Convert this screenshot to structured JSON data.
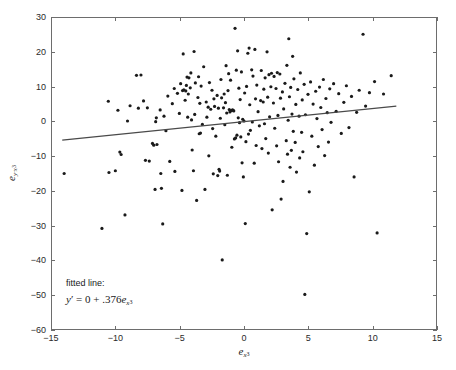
{
  "figure": {
    "top_caption_fragment": "",
    "background_color": "#ffffff",
    "axis_color": "#6d6d6d",
    "marker_color": "#1a1a1a",
    "line_color": "#4a4a4a"
  },
  "axes": {
    "xlabel_base": "e",
    "xlabel_sub": "x",
    "xlabel_subsub": "3",
    "ylabel_base": "e",
    "ylabel_sub": "y·x",
    "ylabel_subsub": "3"
  },
  "annotation": {
    "title": "fitted line:",
    "eq_y": "y",
    "eq_prime": "′",
    "eq_equals": " = 0 + .376",
    "eq_e": "e",
    "eq_sub": "x",
    "eq_subsub": "3",
    "intercept": 0,
    "slope": 0.376
  },
  "chart_data": {
    "type": "scatter",
    "title": "",
    "subtitle": "",
    "xlabel": "e_x3",
    "ylabel": "e_y·x3",
    "xlim": [
      -15,
      15
    ],
    "ylim": [
      -60,
      30
    ],
    "xticks": [
      -15,
      -10,
      -5,
      0,
      5,
      10,
      15
    ],
    "yticks": [
      30,
      20,
      10,
      0,
      -10,
      -20,
      -30,
      -40,
      -50,
      -60
    ],
    "xticklabels": [
      "−15",
      "−10",
      "−5",
      "0",
      "5",
      "10",
      "15"
    ],
    "yticklabels": [
      "30",
      "20",
      "10",
      "0",
      "−10",
      "−20",
      "−30",
      "−40",
      "−50",
      "−60"
    ],
    "grid": false,
    "legend": null,
    "marker": "dot",
    "marker_size": 1.6,
    "n_points": 232,
    "fit_line": {
      "type": "line",
      "label": "fitted line",
      "intercept": 0,
      "slope": 0.376,
      "x_start": -14.2,
      "x_end": 11.9,
      "y_start": -5.34,
      "y_end": 4.47
    },
    "annotations": [
      {
        "text": "fitted line:  y' = 0 + .376e_x3",
        "x": -13.0,
        "y": -50.5
      }
    ],
    "points": [
      [
        -14.05,
        -15.0
      ],
      [
        -11.1,
        -30.9
      ],
      [
        -10.6,
        5.9
      ],
      [
        -10.55,
        -14.7
      ],
      [
        -10.05,
        -14.2
      ],
      [
        -9.85,
        3.3
      ],
      [
        -9.7,
        -8.8
      ],
      [
        -9.6,
        -9.5
      ],
      [
        -9.3,
        -27.0
      ],
      [
        -9.1,
        0.2
      ],
      [
        -8.9,
        4.6
      ],
      [
        -8.4,
        13.4
      ],
      [
        -8.25,
        3.9
      ],
      [
        -8.05,
        13.5
      ],
      [
        -7.85,
        6.0
      ],
      [
        -7.7,
        -11.2
      ],
      [
        -7.55,
        4.0
      ],
      [
        -7.4,
        -11.4
      ],
      [
        -7.15,
        -6.3
      ],
      [
        -7.05,
        -6.8
      ],
      [
        -6.95,
        -19.6
      ],
      [
        -6.9,
        0.0
      ],
      [
        -6.85,
        1.1
      ],
      [
        -6.8,
        -6.6
      ],
      [
        -6.55,
        3.4
      ],
      [
        -6.5,
        -15.0
      ],
      [
        -6.45,
        -19.3
      ],
      [
        -6.35,
        -29.6
      ],
      [
        -6.25,
        1.6
      ],
      [
        -6.1,
        -2.6
      ],
      [
        -5.95,
        7.4
      ],
      [
        -5.8,
        -11.5
      ],
      [
        -5.6,
        5.2
      ],
      [
        -5.45,
        9.6
      ],
      [
        -5.4,
        -14.4
      ],
      [
        -5.2,
        8.2
      ],
      [
        -5.05,
        2.4
      ],
      [
        -4.95,
        11.0
      ],
      [
        -4.85,
        -19.9
      ],
      [
        -4.8,
        9.0
      ],
      [
        -4.75,
        19.6
      ],
      [
        -4.7,
        9.2
      ],
      [
        -4.6,
        6.2
      ],
      [
        -4.55,
        8.9
      ],
      [
        -4.5,
        10.5
      ],
      [
        -4.45,
        12.9
      ],
      [
        -4.4,
        1.3
      ],
      [
        -4.35,
        8.0
      ],
      [
        -4.3,
        12.7
      ],
      [
        -4.2,
        9.8
      ],
      [
        -4.15,
        14.1
      ],
      [
        -4.1,
        0.5
      ],
      [
        -4.05,
        -8.2
      ],
      [
        -3.95,
        -14.2
      ],
      [
        -3.9,
        20.3
      ],
      [
        -3.85,
        2.1
      ],
      [
        -3.8,
        11.2
      ],
      [
        -3.7,
        -22.8
      ],
      [
        -3.6,
        7.0
      ],
      [
        -3.55,
        13.0
      ],
      [
        -3.5,
        -3.5
      ],
      [
        -3.45,
        5.3
      ],
      [
        -3.4,
        -3.3
      ],
      [
        -3.35,
        10.3
      ],
      [
        -3.25,
        -0.8
      ],
      [
        -3.15,
        15.9
      ],
      [
        -3.05,
        -19.6
      ],
      [
        -2.95,
        5.7
      ],
      [
        -2.9,
        1.3
      ],
      [
        -2.8,
        4.2
      ],
      [
        -2.75,
        -9.9
      ],
      [
        -2.7,
        11.3
      ],
      [
        -2.6,
        3.6
      ],
      [
        -2.5,
        9.1
      ],
      [
        -2.45,
        -2.0
      ],
      [
        -2.4,
        -15.1
      ],
      [
        -2.35,
        6.6
      ],
      [
        -2.3,
        4.4
      ],
      [
        -2.2,
        -4.2
      ],
      [
        -2.1,
        7.6
      ],
      [
        -2.05,
        -15.6
      ],
      [
        -2.0,
        3.9
      ],
      [
        -1.95,
        -13.8
      ],
      [
        -1.9,
        -14.3
      ],
      [
        -1.85,
        1.0
      ],
      [
        -1.8,
        12.2
      ],
      [
        -1.75,
        6.9
      ],
      [
        -1.7,
        -40.0
      ],
      [
        -1.6,
        4.0
      ],
      [
        -1.55,
        8.0
      ],
      [
        -1.5,
        -0.9
      ],
      [
        -1.45,
        5.5
      ],
      [
        -1.4,
        16.2
      ],
      [
        -1.35,
        2.5
      ],
      [
        -1.3,
        -15.5
      ],
      [
        -1.25,
        9.0
      ],
      [
        -1.2,
        13.9
      ],
      [
        -1.15,
        3.5
      ],
      [
        -1.1,
        2.8
      ],
      [
        -1.05,
        12.0
      ],
      [
        -1.0,
        3.2
      ],
      [
        -0.95,
        -7.4
      ],
      [
        -0.9,
        3.4
      ],
      [
        -0.85,
        3.3
      ],
      [
        -0.8,
        3.1
      ],
      [
        -0.75,
        -5.0
      ],
      [
        -0.7,
        27.0
      ],
      [
        -0.65,
        -4.7
      ],
      [
        -0.6,
        14.9
      ],
      [
        -0.55,
        -3.9
      ],
      [
        -0.5,
        20.5
      ],
      [
        -0.45,
        1.1
      ],
      [
        -0.4,
        9.7
      ],
      [
        -0.35,
        -0.3
      ],
      [
        -0.3,
        6.4
      ],
      [
        -0.25,
        -4.4
      ],
      [
        -0.2,
        14.4
      ],
      [
        -0.15,
        -11.9
      ],
      [
        -0.1,
        0.7
      ],
      [
        -0.05,
        -16.0
      ],
      [
        0.0,
        0.2
      ],
      [
        0.05,
        8.3
      ],
      [
        0.1,
        -29.5
      ],
      [
        0.15,
        -5.8
      ],
      [
        0.2,
        10.2
      ],
      [
        0.3,
        19.8
      ],
      [
        0.35,
        -3.6
      ],
      [
        0.4,
        21.3
      ],
      [
        0.45,
        4.9
      ],
      [
        0.5,
        -2.5
      ],
      [
        0.6,
        15.0
      ],
      [
        0.65,
        -0.1
      ],
      [
        0.7,
        13.2
      ],
      [
        0.8,
        -12.0
      ],
      [
        0.85,
        20.9
      ],
      [
        0.9,
        6.6
      ],
      [
        0.95,
        -6.9
      ],
      [
        1.0,
        10.6
      ],
      [
        1.1,
        2.9
      ],
      [
        1.2,
        -1.2
      ],
      [
        1.3,
        6.1
      ],
      [
        1.35,
        14.8
      ],
      [
        1.4,
        -7.8
      ],
      [
        1.5,
        5.7
      ],
      [
        1.55,
        9.4
      ],
      [
        1.6,
        -0.6
      ],
      [
        1.65,
        12.7
      ],
      [
        1.7,
        -4.9
      ],
      [
        1.8,
        20.2
      ],
      [
        1.85,
        7.1
      ],
      [
        1.9,
        -9.1
      ],
      [
        1.95,
        13.6
      ],
      [
        2.0,
        1.4
      ],
      [
        2.1,
        10.1
      ],
      [
        2.15,
        14.0
      ],
      [
        2.2,
        -25.5
      ],
      [
        2.3,
        5.4
      ],
      [
        2.35,
        13.1
      ],
      [
        2.4,
        -1.9
      ],
      [
        2.5,
        9.6
      ],
      [
        2.55,
        -7.0
      ],
      [
        2.6,
        14.2
      ],
      [
        2.65,
        1.8
      ],
      [
        2.7,
        -11.6
      ],
      [
        2.8,
        13.8
      ],
      [
        2.85,
        6.8
      ],
      [
        2.9,
        -22.4
      ],
      [
        3.0,
        8.6
      ],
      [
        3.05,
        -17.3
      ],
      [
        3.1,
        3.7
      ],
      [
        3.2,
        11.1
      ],
      [
        3.3,
        -5.5
      ],
      [
        3.35,
        16.3
      ],
      [
        3.4,
        -9.4
      ],
      [
        3.45,
        0.4
      ],
      [
        3.5,
        24.0
      ],
      [
        3.55,
        7.2
      ],
      [
        3.6,
        -13.2
      ],
      [
        3.65,
        9.9
      ],
      [
        3.7,
        -8.3
      ],
      [
        3.75,
        2.2
      ],
      [
        3.8,
        18.9
      ],
      [
        3.85,
        -2.8
      ],
      [
        3.9,
        12.4
      ],
      [
        4.0,
        -6.0
      ],
      [
        4.05,
        5.0
      ],
      [
        4.1,
        -14.6
      ],
      [
        4.2,
        9.3
      ],
      [
        4.3,
        1.6
      ],
      [
        4.35,
        -10.5
      ],
      [
        4.4,
        14.1
      ],
      [
        4.5,
        -3.1
      ],
      [
        4.55,
        6.3
      ],
      [
        4.6,
        -8.7
      ],
      [
        4.7,
        10.8
      ],
      [
        4.75,
        -50.0
      ],
      [
        4.8,
        2.0
      ],
      [
        4.9,
        -32.4
      ],
      [
        5.0,
        7.9
      ],
      [
        5.1,
        -20.3
      ],
      [
        5.2,
        11.5
      ],
      [
        5.3,
        -4.2
      ],
      [
        5.4,
        5.1
      ],
      [
        5.5,
        -12.6
      ],
      [
        5.6,
        8.8
      ],
      [
        5.7,
        0.9
      ],
      [
        5.8,
        -7.2
      ],
      [
        5.9,
        10.0
      ],
      [
        6.0,
        4.1
      ],
      [
        6.1,
        -2.3
      ],
      [
        6.2,
        12.2
      ],
      [
        6.3,
        -9.8
      ],
      [
        6.4,
        6.7
      ],
      [
        6.5,
        2.6
      ],
      [
        6.6,
        -5.9
      ],
      [
        6.7,
        9.5
      ],
      [
        6.8,
        -0.2
      ],
      [
        7.0,
        11.0
      ],
      [
        7.2,
        3.0
      ],
      [
        7.4,
        8.1
      ],
      [
        7.6,
        -3.4
      ],
      [
        7.8,
        5.6
      ],
      [
        8.0,
        10.4
      ],
      [
        8.2,
        -1.7
      ],
      [
        8.4,
        7.3
      ],
      [
        8.6,
        -16.0
      ],
      [
        8.8,
        2.7
      ],
      [
        9.0,
        9.1
      ],
      [
        9.3,
        25.3
      ],
      [
        9.5,
        4.5
      ],
      [
        9.8,
        8.4
      ],
      [
        10.2,
        11.6
      ],
      [
        10.4,
        -32.2
      ],
      [
        10.9,
        8.0
      ],
      [
        11.5,
        13.3
      ]
    ]
  }
}
